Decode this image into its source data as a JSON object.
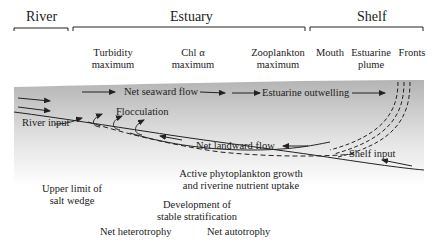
{
  "regions": {
    "river": "River",
    "estuary": "Estuary",
    "shelf": "Shelf"
  },
  "zone_labels": {
    "turbidity_max_1": "Turbidity",
    "turbidity_max_2": "maximum",
    "chla_max_1": "Chl α",
    "chla_max_2": "maximum",
    "zoo_max_1": "Zooplankton",
    "zoo_max_2": "maximum",
    "mouth": "Mouth",
    "plume_1": "Estuarine",
    "plume_2": "plume",
    "fronts": "Fronts"
  },
  "flow_labels": {
    "net_seaward_flow": "Net seaward flow",
    "estuarine_outwelling": "Estuarine outwelling",
    "flocculation": "Flocculation",
    "river_input": "River input",
    "net_landward_flow": "Net landward flow",
    "shelf_input": "Shelf input"
  },
  "process_labels": {
    "phyto_1": "Active phytoplankton growth",
    "phyto_2": "and riverine nutrient uptake",
    "salt_wedge_1": "Upper limit of",
    "salt_wedge_2": "salt wedge",
    "stratification_1": "Development of",
    "stratification_2": "stable stratification",
    "heterotrophy": "Net heterotrophy",
    "autotrophy": "Net autotrophy"
  },
  "colors": {
    "water_top": "#b8b8b8",
    "water_bottom": "#ffffff",
    "ink": "#222222"
  }
}
